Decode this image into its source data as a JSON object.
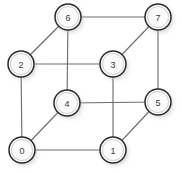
{
  "figure": {
    "width": 182,
    "height": 173,
    "background_color": "#ffffff"
  },
  "style": {
    "node_fill": "#fbfbfb",
    "node_stroke": "#2b2b2b",
    "node_inner_ring": "#cfcfcf",
    "edge_color": "#6e6e6e",
    "label_color": "#3a3a3a",
    "shadow_color": "#b9b9b9",
    "node_radius": 13,
    "inner_radius": 10.5,
    "edge_width": 1.15
  },
  "chart_data": {
    "type": "diagram",
    "nodes": [
      {
        "id": "0",
        "label": "0",
        "x": 22,
        "y": 150
      },
      {
        "id": "1",
        "label": "1",
        "x": 113,
        "y": 150
      },
      {
        "id": "2",
        "label": "2",
        "x": 21,
        "y": 64
      },
      {
        "id": "3",
        "label": "3",
        "x": 113,
        "y": 64
      },
      {
        "id": "4",
        "label": "4",
        "x": 67,
        "y": 103
      },
      {
        "id": "5",
        "label": "5",
        "x": 158,
        "y": 102
      },
      {
        "id": "6",
        "label": "6",
        "x": 68,
        "y": 17
      },
      {
        "id": "7",
        "label": "7",
        "x": 158,
        "y": 17
      }
    ],
    "edges": [
      {
        "from": "0",
        "to": "1",
        "kind": "front-bottom"
      },
      {
        "from": "0",
        "to": "2",
        "kind": "front-left"
      },
      {
        "from": "0",
        "to": "4",
        "kind": "depth-diagonal"
      },
      {
        "from": "1",
        "to": "3",
        "kind": "front-right"
      },
      {
        "from": "1",
        "to": "5",
        "kind": "depth-diagonal"
      },
      {
        "from": "2",
        "to": "3",
        "kind": "front-top"
      },
      {
        "from": "2",
        "to": "6",
        "kind": "depth-diagonal"
      },
      {
        "from": "3",
        "to": "7",
        "kind": "depth-diagonal"
      },
      {
        "from": "4",
        "to": "5",
        "kind": "back-bottom"
      },
      {
        "from": "4",
        "to": "6",
        "kind": "back-left"
      },
      {
        "from": "5",
        "to": "7",
        "kind": "back-right"
      },
      {
        "from": "6",
        "to": "7",
        "kind": "back-top"
      }
    ],
    "node_count": 8,
    "edge_count": 12
  }
}
